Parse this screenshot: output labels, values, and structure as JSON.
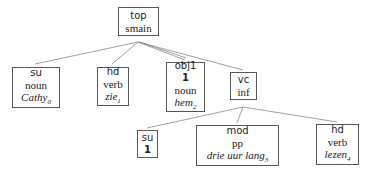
{
  "nodes": {
    "top": {
      "rel": "top",
      "cat": "smain"
    },
    "su": {
      "rel": "su",
      "cat": "noun",
      "word": "Cathy",
      "pos": "0"
    },
    "hd": {
      "rel": "hd",
      "cat": "verb",
      "word": "zie",
      "pos": "1"
    },
    "obj1": {
      "rel": "obj1",
      "index": "1",
      "cat": "noun",
      "word": "hem",
      "pos": "2"
    },
    "vc": {
      "rel": "vc",
      "cat": "inf"
    },
    "su2": {
      "rel": "su",
      "index": "1"
    },
    "mod": {
      "rel": "mod",
      "cat": "pp",
      "word": "drie uur lang",
      "pos": "3"
    },
    "hd2": {
      "rel": "hd",
      "cat": "verb",
      "word": "lezen",
      "pos": "4"
    }
  },
  "colors": {
    "line": "#666666",
    "border": "#555555",
    "text": "#222222"
  }
}
